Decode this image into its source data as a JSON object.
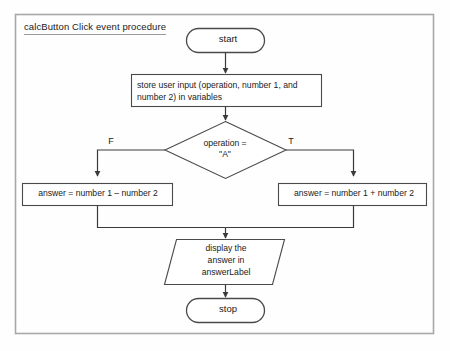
{
  "diagram": {
    "title": "calcButton Click event procedure",
    "colors": {
      "stroke": "#4a4a4a",
      "frame": "#a8a8a8",
      "text": "#1a1a1a",
      "background": "#fefefe"
    },
    "nodes": {
      "start": {
        "type": "terminator",
        "label": "start"
      },
      "store_input": {
        "type": "process",
        "label": "store user input (operation, number 1, and number 2) in variables"
      },
      "decision": {
        "type": "decision",
        "label": "operation =\n\"A\""
      },
      "false_branch_label": "F",
      "true_branch_label": "T",
      "false_process": {
        "type": "process",
        "label": "answer = number 1 – number 2"
      },
      "true_process": {
        "type": "process",
        "label": "answer = number 1 + number 2"
      },
      "display": {
        "type": "output",
        "label": "display the\nanswer in\nanswerLabel"
      },
      "stop": {
        "type": "terminator",
        "label": "stop"
      }
    }
  }
}
